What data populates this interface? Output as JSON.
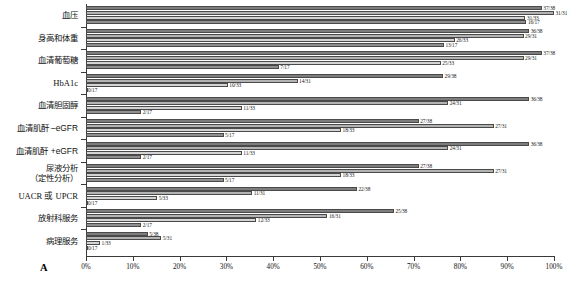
{
  "panel": {
    "letter": "A"
  },
  "chart_data": {
    "type": "bar",
    "orientation": "horizontal",
    "title": "",
    "xlabel": "",
    "ylabel": "",
    "xlim": [
      0,
      100
    ],
    "xticks": [
      "0%",
      "10%",
      "20%",
      "30%",
      "40%",
      "50%",
      "60%",
      "70%",
      "80%",
      "90%",
      "100%"
    ],
    "grid": false,
    "legend": "none",
    "categories": [
      "血压",
      "身高和体重",
      "血清葡萄糖",
      "HbA1c",
      "血清胆固醇",
      "血清肌酐 –eGFR",
      "血清肌酐 +eGFR",
      "尿液分析\n（定性分析）",
      "UACR 或 UPCR",
      "放射科服务",
      "病理服务"
    ],
    "series": [
      {
        "name": "series-1",
        "color": "#7d7d7d",
        "denominator": 38,
        "labels": [
          "37/38",
          "36/38",
          "37/38",
          "29/38",
          "36/38",
          "27/38",
          "36/38",
          "27/38",
          "22/38",
          "25/38",
          "5/38"
        ],
        "values": [
          97.4,
          94.7,
          97.4,
          76.3,
          94.7,
          71.1,
          94.7,
          71.1,
          57.9,
          65.8,
          13.2
        ]
      },
      {
        "name": "series-2",
        "color": "#b3b3b3",
        "denominator": 31,
        "labels": [
          "31/31",
          "29/31",
          "29/31",
          "14/31",
          "24/31",
          "27/31",
          "24/31",
          "27/31",
          "11/31",
          "16/31",
          "5/31"
        ],
        "values": [
          100.0,
          93.5,
          93.5,
          45.2,
          77.4,
          87.1,
          77.4,
          87.1,
          35.5,
          51.6,
          16.1
        ]
      },
      {
        "name": "series-3",
        "color": "#d4d4d4",
        "denominator": 33,
        "labels": [
          "31/33",
          "26/33",
          "25/33",
          "10/33",
          "11/33",
          "18/33",
          "11/33",
          "18/33",
          "5/33",
          "12/33",
          "1/33"
        ],
        "values": [
          93.9,
          78.8,
          75.8,
          30.3,
          33.3,
          54.5,
          33.3,
          54.5,
          15.2,
          36.4,
          3.0
        ]
      },
      {
        "name": "series-4",
        "color": "#8f8f8f",
        "denominator": 17,
        "labels": [
          "16/17",
          "13/17",
          "7/17",
          "0/17",
          "2/17",
          "5/17",
          "2/17",
          "5/17",
          "0/17",
          "2/17",
          "0/17"
        ],
        "values": [
          94.1,
          76.5,
          41.2,
          0.0,
          11.8,
          29.4,
          11.8,
          29.4,
          0.0,
          11.8,
          0.0
        ]
      }
    ]
  }
}
